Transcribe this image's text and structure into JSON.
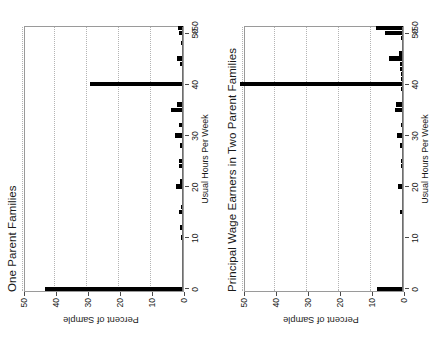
{
  "page": {
    "orientation": "landscape-rotated-90ccw",
    "background": "#ffffff",
    "bar_color": "#000000",
    "grid_color": "#b4b4b4",
    "axis_color": "#6e6e6e"
  },
  "chart_data": [
    {
      "type": "bar",
      "orientation": "horizontal",
      "title": "One Parent Families",
      "xlabel": "Usual Hours Per Week",
      "ylabel": "Percent of Sample",
      "ylim": [
        0,
        50
      ],
      "yticks": [
        0,
        10,
        20,
        30,
        40,
        50
      ],
      "xticks": [
        0,
        10,
        20,
        30,
        40,
        50
      ],
      "xticklabels": [
        "0",
        "10",
        "20",
        "30",
        "40",
        "50",
        ">50"
      ],
      "grid": true,
      "legend": "none",
      "categories": [
        0,
        1,
        2,
        3,
        4,
        5,
        6,
        7,
        8,
        9,
        10,
        11,
        12,
        13,
        14,
        15,
        16,
        17,
        18,
        19,
        20,
        21,
        22,
        23,
        24,
        25,
        26,
        27,
        28,
        29,
        30,
        31,
        32,
        33,
        34,
        35,
        36,
        37,
        38,
        39,
        40,
        41,
        42,
        43,
        44,
        45,
        46,
        47,
        48,
        49,
        50,
        51
      ],
      "values": [
        43.0,
        0,
        0,
        0,
        0,
        0.4,
        0,
        0,
        0,
        0,
        0.5,
        0,
        1.0,
        0,
        0,
        1.2,
        0.7,
        0,
        0,
        0,
        2.3,
        0.8,
        0,
        0,
        1.2,
        1.3,
        0,
        0,
        0.9,
        0,
        2.5,
        0,
        1.2,
        0,
        0,
        3.9,
        1.8,
        0,
        0,
        0,
        29.0,
        0.3,
        0,
        0,
        0.8,
        1.9,
        0.3,
        0,
        0.5,
        0,
        1.2,
        1.6
      ]
    },
    {
      "type": "bar",
      "orientation": "horizontal",
      "title": "Principal Wage Earners in Two Parent Families",
      "xlabel": "Usual Hours Per Week",
      "ylabel": "Percent of Sample",
      "ylim": [
        0,
        50
      ],
      "yticks": [
        0,
        10,
        20,
        30,
        40,
        50
      ],
      "xticks": [
        0,
        10,
        20,
        30,
        40,
        50
      ],
      "xticklabels": [
        "0",
        "10",
        "20",
        "30",
        "40",
        "50",
        ">50"
      ],
      "grid": true,
      "legend": "none",
      "categories": [
        0,
        1,
        2,
        3,
        4,
        5,
        6,
        7,
        8,
        9,
        10,
        11,
        12,
        13,
        14,
        15,
        16,
        17,
        18,
        19,
        20,
        21,
        22,
        23,
        24,
        25,
        26,
        27,
        28,
        29,
        30,
        31,
        32,
        33,
        34,
        35,
        36,
        37,
        38,
        39,
        40,
        41,
        42,
        43,
        44,
        45,
        46,
        47,
        48,
        49,
        50,
        51
      ],
      "values": [
        8.0,
        0,
        0,
        0,
        0.2,
        0.3,
        0,
        0,
        0,
        0,
        0.4,
        0,
        0.3,
        0,
        0,
        1.0,
        0.3,
        0,
        0,
        0,
        1.5,
        0.4,
        0,
        0,
        0.6,
        0.5,
        0,
        0,
        0.8,
        0,
        1.9,
        0.3,
        0.5,
        0,
        0,
        2.5,
        2.3,
        0,
        0,
        0.5,
        51.0,
        0.6,
        0.5,
        0.9,
        1.0,
        4.5,
        1.4,
        0,
        0,
        0.5,
        5.5,
        8.5
      ]
    }
  ],
  "panels": [
    {
      "name": "one-parent-families-panel",
      "index": 0
    },
    {
      "name": "principal-wage-earners-panel",
      "index": 1
    }
  ]
}
